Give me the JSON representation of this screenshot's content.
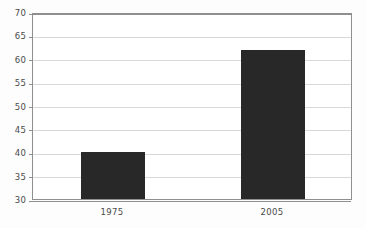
{
  "chart_data": {
    "type": "bar",
    "title": "",
    "subtitle": "",
    "xlabel": "",
    "ylabel": "",
    "categories": [
      "1975",
      "2005"
    ],
    "values": [
      40,
      61.8
    ],
    "series": [
      {
        "name": "",
        "values": [
          40,
          61.8
        ]
      }
    ],
    "ylim": [
      30,
      70
    ],
    "ytick_values": [
      30,
      35,
      40,
      45,
      50,
      55,
      60,
      65,
      70
    ],
    "ytick_labels": [
      "30",
      "35",
      "40",
      "45",
      "50",
      "55",
      "60",
      "65",
      "70"
    ],
    "ytick_step": 5,
    "grid": true,
    "grid_axis": "y",
    "legend": false,
    "legend_position": "none",
    "annotations": [],
    "bar_color": "#282828",
    "grid_color": "#d8d8d8",
    "axis_color": "#8f8f8f",
    "background_color": "#ffffff",
    "text_color": "#4a4a4a"
  }
}
